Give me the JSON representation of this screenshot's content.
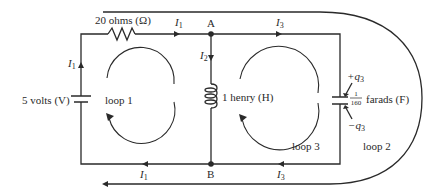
{
  "diagram": {
    "components": {
      "resistor": {
        "label": "20 ohms (Ω)"
      },
      "voltage_source": {
        "label": "5 volts (V)"
      },
      "inductor": {
        "label": "1 henry (H)"
      },
      "capacitor": {
        "label_suffix": "farads (F)",
        "fraction_numerator": "1",
        "fraction_denominator": "160",
        "plus_charge": "+q",
        "minus_charge": "−q",
        "charge_subscript": "3"
      }
    },
    "nodes": {
      "a": "A",
      "b": "B"
    },
    "currents": {
      "i1_top": {
        "symbol": "I",
        "subscript": "1"
      },
      "i1_left": {
        "symbol": "I",
        "subscript": "1"
      },
      "i1_bottom": {
        "symbol": "I",
        "subscript": "1"
      },
      "i2": {
        "symbol": "I",
        "subscript": "2"
      },
      "i3_top": {
        "symbol": "I",
        "subscript": "3"
      },
      "i3_bottom": {
        "symbol": "I",
        "subscript": "3"
      }
    },
    "loops": {
      "loop1": "loop 1",
      "loop2": "loop 2",
      "loop3": "loop 3"
    },
    "colors": {
      "ink": "#2a2a2a",
      "background": "#ffffff"
    }
  }
}
